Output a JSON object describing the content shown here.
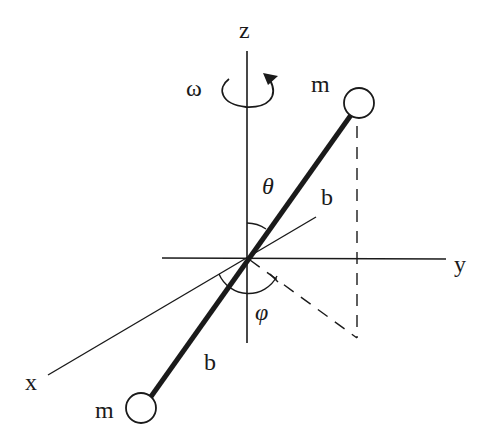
{
  "diagram": {
    "axes": {
      "z_label": "z",
      "y_label": "y",
      "x_label": "x"
    },
    "angular_velocity_label": "ω",
    "theta_label": "θ",
    "phi_label": "φ",
    "masses": {
      "top_label": "m",
      "bottom_label": "m"
    },
    "lengths": {
      "upper_b_label": "b",
      "lower_b_label": "b"
    },
    "colors": {
      "ink": "#1a1a1a",
      "background": "#ffffff"
    }
  }
}
